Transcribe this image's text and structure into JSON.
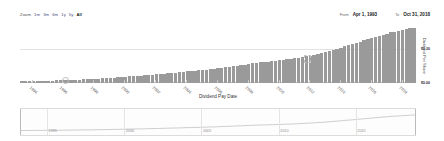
{
  "toolbar": {
    "zoom_label": "Zoom",
    "ranges": [
      "1m",
      "3m",
      "6m",
      "1y",
      "5y",
      "All"
    ],
    "selected_range": "All",
    "from_label": "From",
    "from_value": "Apr 1, 1993",
    "to_label": "To",
    "to_value": "Oct 31, 2018"
  },
  "chart_data": {
    "type": "bar",
    "title": "",
    "xlabel": "Dividend Pay Date",
    "ylabel": "Dividend Per Share",
    "ylim": [
      0,
      0.32
    ],
    "grid": true,
    "legend": "none",
    "yticks": [
      "$0.00",
      "$0.20"
    ],
    "ytick_values": [
      0.0,
      0.2
    ],
    "xticks": [
      "1994",
      "1996",
      "1998",
      "2000",
      "2002",
      "2004",
      "2006",
      "2008",
      "2010",
      "2012",
      "2014",
      "2016",
      "2018"
    ],
    "categories": [
      "1993 Q2",
      "1993 Q3",
      "1993 Q4",
      "1994 Q1",
      "1994 Q2",
      "1994 Q3",
      "1994 Q4",
      "1995 Q1",
      "1995 Q2",
      "1995 Q3",
      "1995 Q4",
      "1996 Q1",
      "1996 Q2",
      "1996 Q3",
      "1996 Q4",
      "1997 Q1",
      "1997 Q2",
      "1997 Q3",
      "1997 Q4",
      "1998 Q1",
      "1998 Q2",
      "1998 Q3",
      "1998 Q4",
      "1999 Q1",
      "1999 Q2",
      "1999 Q3",
      "1999 Q4",
      "2000 Q1",
      "2000 Q2",
      "2000 Q3",
      "2000 Q4",
      "2001 Q1",
      "2001 Q2",
      "2001 Q3",
      "2001 Q4",
      "2002 Q1",
      "2002 Q2",
      "2002 Q3",
      "2002 Q4",
      "2003 Q1",
      "2003 Q2",
      "2003 Q3",
      "2003 Q4",
      "2004 Q1",
      "2004 Q2",
      "2004 Q3",
      "2004 Q4",
      "2005 Q1",
      "2005 Q2",
      "2005 Q3",
      "2005 Q4",
      "2006 Q1",
      "2006 Q2",
      "2006 Q3",
      "2006 Q4",
      "2007 Q1",
      "2007 Q2",
      "2007 Q3",
      "2007 Q4",
      "2008 Q1",
      "2008 Q2",
      "2008 Q3",
      "2008 Q4",
      "2009 Q1",
      "2009 Q2",
      "2009 Q3",
      "2009 Q4",
      "2010 Q1",
      "2010 Q2",
      "2010 Q3",
      "2010 Q4",
      "2011 Q1",
      "2011 Q2",
      "2011 Q3",
      "2011 Q4",
      "2012 Q1",
      "2012 Q2",
      "2012 Q3",
      "2012 Q4",
      "2013 Q1",
      "2013 Q2",
      "2013 Q3",
      "2013 Q4",
      "2014 Q1",
      "2014 Q2",
      "2014 Q3",
      "2014 Q4",
      "2015 Q1",
      "2015 Q2",
      "2015 Q3",
      "2015 Q4",
      "2016 Q1",
      "2016 Q2",
      "2016 Q3",
      "2016 Q4",
      "2017 Q1",
      "2017 Q2",
      "2017 Q3",
      "2017 Q4",
      "2018 Q1",
      "2018 Q2",
      "2018 Q3",
      "2018 Q4"
    ],
    "values": [
      0.01,
      0.01,
      0.01,
      0.012,
      0.012,
      0.012,
      0.013,
      0.014,
      0.014,
      0.015,
      0.015,
      0.016,
      0.017,
      0.017,
      0.018,
      0.02,
      0.021,
      0.022,
      0.023,
      0.025,
      0.026,
      0.027,
      0.028,
      0.03,
      0.031,
      0.033,
      0.034,
      0.036,
      0.038,
      0.039,
      0.041,
      0.043,
      0.045,
      0.046,
      0.048,
      0.05,
      0.052,
      0.054,
      0.056,
      0.058,
      0.06,
      0.062,
      0.064,
      0.067,
      0.069,
      0.071,
      0.073,
      0.076,
      0.078,
      0.081,
      0.083,
      0.086,
      0.089,
      0.092,
      0.095,
      0.098,
      0.101,
      0.104,
      0.107,
      0.111,
      0.114,
      0.117,
      0.12,
      0.122,
      0.124,
      0.126,
      0.128,
      0.131,
      0.134,
      0.137,
      0.14,
      0.144,
      0.148,
      0.152,
      0.156,
      0.16,
      0.165,
      0.17,
      0.175,
      0.181,
      0.187,
      0.193,
      0.199,
      0.206,
      0.213,
      0.22,
      0.227,
      0.234,
      0.241,
      0.248,
      0.255,
      0.262,
      0.269,
      0.276,
      0.282,
      0.288,
      0.294,
      0.299,
      0.304,
      0.309,
      0.314,
      0.318,
      0.322
    ]
  },
  "navigator": {
    "ticks": [
      "1995",
      "2000",
      "2005",
      "2010",
      "2015"
    ],
    "series_shape": "rising-line"
  }
}
